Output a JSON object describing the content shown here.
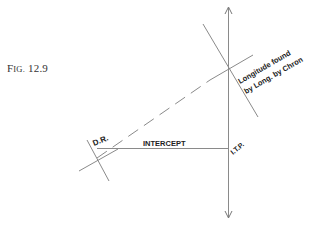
{
  "figure": {
    "label_prefix_big": "F",
    "label_prefix_small": "IG.",
    "label_number": " 12.9"
  },
  "labels": {
    "dr": "D.R.",
    "intercept": "INTERCEPT",
    "itp": "I.T.P.",
    "longitude_line1": "Longitude found",
    "longitude_line2": "by  Long. by Chron"
  },
  "colors": {
    "line": "#8a8a8a",
    "text": "#222222",
    "background": "#ffffff"
  }
}
